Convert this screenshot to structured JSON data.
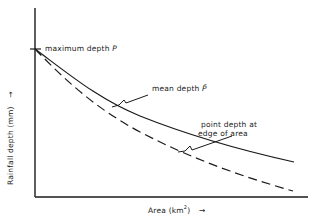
{
  "diagram": {
    "x_axis_label": "Area (km",
    "x_axis_sup": "2",
    "x_axis_tail": ")",
    "x_axis_arrow": "→",
    "y_axis_label": "Rainfall depth (mm)",
    "y_axis_arrow": "→",
    "annotations": {
      "max_depth": "maximum depth",
      "max_depth_symbol": "P",
      "mean_depth": "mean depth",
      "mean_depth_symbol": "P̄",
      "point_depth_line1": "point depth at",
      "point_depth_line2": "edge of area"
    },
    "curves": [
      {
        "name": "mean depth",
        "style": "solid"
      },
      {
        "name": "point depth at edge of area",
        "style": "dashed"
      }
    ],
    "line_color": "#1a1a1a"
  }
}
